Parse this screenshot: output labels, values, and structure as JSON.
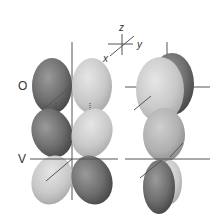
{
  "figure": {
    "axes_triad": {
      "x_label": "x",
      "y_label": "y",
      "z_label": "z"
    },
    "rows": [
      {
        "label": "O"
      },
      {
        "label": "V"
      }
    ],
    "colors": {
      "dark_lobe": "#6e6e6e",
      "light_lobe": "#c8c8c8",
      "axis_line": "#555555",
      "text": "#333333",
      "background": "#ffffff"
    }
  }
}
